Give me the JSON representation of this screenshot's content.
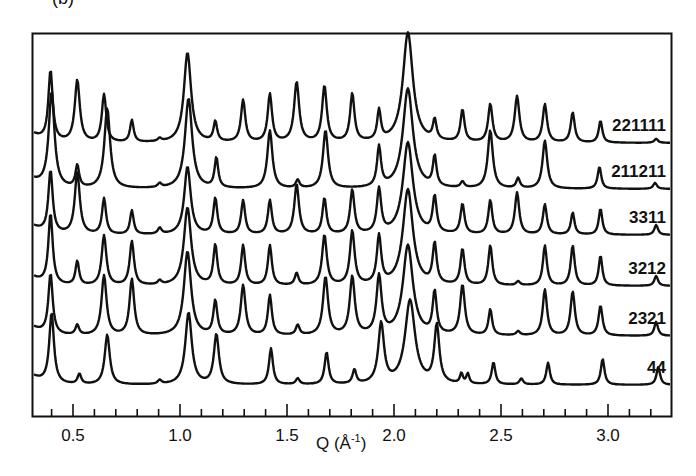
{
  "panel_label": "(b)",
  "chart_data": {
    "type": "line",
    "title": "",
    "xlabel": "Q (Å⁻¹)",
    "xlabel_main": "Q (Å",
    "xlabel_sup": "-1",
    "xlabel_close": ")",
    "ylabel": "",
    "xlim": [
      0.31,
      3.3
    ],
    "xticks_major": [
      0.5,
      1.0,
      1.5,
      2.0,
      2.5,
      3.0
    ],
    "xtick_labels": [
      "0.5",
      "1.0",
      "1.5",
      "2.0",
      "2.5",
      "3.0"
    ],
    "xticks_minor_step": 0.1,
    "grid": false,
    "legend": "inline labels at right end of each curve",
    "series": [
      {
        "name": "221111",
        "baseline_px": 143,
        "peaks": [
          [
            0.395,
            70,
            0.012
          ],
          [
            0.52,
            62,
            0.014
          ],
          [
            0.645,
            48,
            0.012
          ],
          [
            0.775,
            22,
            0.01
          ],
          [
            0.905,
            3,
            0.01
          ],
          [
            1.035,
            90,
            0.02
          ],
          [
            1.165,
            20,
            0.01
          ],
          [
            1.295,
            42,
            0.012
          ],
          [
            1.42,
            48,
            0.012
          ],
          [
            1.545,
            60,
            0.014
          ],
          [
            1.675,
            56,
            0.013
          ],
          [
            1.805,
            48,
            0.012
          ],
          [
            1.93,
            30,
            0.01
          ],
          [
            2.065,
            110,
            0.028
          ],
          [
            2.19,
            20,
            0.01
          ],
          [
            2.32,
            32,
            0.011
          ],
          [
            2.45,
            38,
            0.012
          ],
          [
            2.575,
            46,
            0.013
          ],
          [
            2.705,
            38,
            0.012
          ],
          [
            2.835,
            30,
            0.011
          ],
          [
            2.965,
            22,
            0.01
          ],
          [
            3.225,
            4,
            0.01
          ]
        ]
      },
      {
        "name": "211211",
        "baseline_px": 189,
        "peaks": [
          [
            0.4,
            95,
            0.016
          ],
          [
            0.52,
            22,
            0.01
          ],
          [
            0.66,
            80,
            0.016
          ],
          [
            0.905,
            4,
            0.01
          ],
          [
            1.04,
            90,
            0.02
          ],
          [
            1.17,
            30,
            0.01
          ],
          [
            1.42,
            58,
            0.014
          ],
          [
            1.55,
            8,
            0.01
          ],
          [
            1.68,
            58,
            0.014
          ],
          [
            1.93,
            40,
            0.011
          ],
          [
            2.065,
            100,
            0.028
          ],
          [
            2.19,
            30,
            0.01
          ],
          [
            2.32,
            6,
            0.01
          ],
          [
            2.45,
            58,
            0.014
          ],
          [
            2.58,
            10,
            0.01
          ],
          [
            2.705,
            48,
            0.013
          ],
          [
            2.96,
            22,
            0.01
          ],
          [
            3.22,
            6,
            0.01
          ]
        ]
      },
      {
        "name": "3311",
        "baseline_px": 235,
        "peaks": [
          [
            0.395,
            62,
            0.012
          ],
          [
            0.52,
            62,
            0.014
          ],
          [
            0.645,
            36,
            0.011
          ],
          [
            0.775,
            24,
            0.01
          ],
          [
            0.905,
            6,
            0.01
          ],
          [
            1.035,
            68,
            0.018
          ],
          [
            1.165,
            36,
            0.011
          ],
          [
            1.295,
            34,
            0.011
          ],
          [
            1.42,
            34,
            0.011
          ],
          [
            1.545,
            50,
            0.013
          ],
          [
            1.675,
            36,
            0.011
          ],
          [
            1.805,
            44,
            0.012
          ],
          [
            1.93,
            44,
            0.012
          ],
          [
            2.065,
            92,
            0.028
          ],
          [
            2.19,
            36,
            0.011
          ],
          [
            2.32,
            30,
            0.011
          ],
          [
            2.45,
            34,
            0.011
          ],
          [
            2.575,
            42,
            0.012
          ],
          [
            2.705,
            30,
            0.011
          ],
          [
            2.835,
            22,
            0.01
          ],
          [
            2.965,
            26,
            0.01
          ],
          [
            3.225,
            10,
            0.01
          ]
        ]
      },
      {
        "name": "3212",
        "baseline_px": 286,
        "peaks": [
          [
            0.395,
            70,
            0.012
          ],
          [
            0.52,
            24,
            0.01
          ],
          [
            0.645,
            50,
            0.013
          ],
          [
            0.775,
            44,
            0.012
          ],
          [
            0.905,
            4,
            0.01
          ],
          [
            1.035,
            78,
            0.02
          ],
          [
            1.165,
            40,
            0.011
          ],
          [
            1.295,
            40,
            0.011
          ],
          [
            1.42,
            40,
            0.011
          ],
          [
            1.545,
            12,
            0.01
          ],
          [
            1.675,
            50,
            0.013
          ],
          [
            1.805,
            54,
            0.013
          ],
          [
            1.93,
            48,
            0.012
          ],
          [
            2.065,
            96,
            0.028
          ],
          [
            2.19,
            40,
            0.011
          ],
          [
            2.32,
            36,
            0.011
          ],
          [
            2.45,
            40,
            0.011
          ],
          [
            2.58,
            4,
            0.01
          ],
          [
            2.705,
            40,
            0.011
          ],
          [
            2.835,
            40,
            0.011
          ],
          [
            2.965,
            30,
            0.01
          ],
          [
            3.225,
            10,
            0.01
          ]
        ]
      },
      {
        "name": "2321",
        "baseline_px": 336,
        "peaks": [
          [
            0.395,
            60,
            0.012
          ],
          [
            0.52,
            10,
            0.01
          ],
          [
            0.645,
            60,
            0.014
          ],
          [
            0.775,
            56,
            0.013
          ],
          [
            1.035,
            84,
            0.02
          ],
          [
            1.165,
            34,
            0.011
          ],
          [
            1.295,
            50,
            0.013
          ],
          [
            1.42,
            40,
            0.011
          ],
          [
            1.55,
            10,
            0.01
          ],
          [
            1.68,
            58,
            0.014
          ],
          [
            1.805,
            58,
            0.014
          ],
          [
            1.93,
            58,
            0.014
          ],
          [
            2.065,
            90,
            0.028
          ],
          [
            2.19,
            42,
            0.011
          ],
          [
            2.32,
            50,
            0.013
          ],
          [
            2.45,
            26,
            0.01
          ],
          [
            2.58,
            4,
            0.01
          ],
          [
            2.705,
            46,
            0.012
          ],
          [
            2.835,
            44,
            0.012
          ],
          [
            2.965,
            30,
            0.011
          ],
          [
            3.225,
            14,
            0.01
          ]
        ]
      },
      {
        "name": "44",
        "baseline_px": 385,
        "peaks": [
          [
            0.4,
            70,
            0.013
          ],
          [
            0.53,
            10,
            0.01
          ],
          [
            0.66,
            50,
            0.014
          ],
          [
            0.905,
            4,
            0.01
          ],
          [
            1.04,
            72,
            0.018
          ],
          [
            1.17,
            50,
            0.014
          ],
          [
            1.425,
            36,
            0.011
          ],
          [
            1.55,
            6,
            0.01
          ],
          [
            1.685,
            32,
            0.011
          ],
          [
            1.815,
            14,
            0.01
          ],
          [
            1.94,
            60,
            0.016
          ],
          [
            2.075,
            84,
            0.028
          ],
          [
            2.2,
            58,
            0.014
          ],
          [
            2.315,
            10,
            0.008
          ],
          [
            2.345,
            10,
            0.008
          ],
          [
            2.465,
            22,
            0.01
          ],
          [
            2.595,
            6,
            0.01
          ],
          [
            2.72,
            22,
            0.01
          ],
          [
            2.975,
            26,
            0.01
          ],
          [
            3.235,
            18,
            0.01
          ]
        ]
      }
    ]
  }
}
